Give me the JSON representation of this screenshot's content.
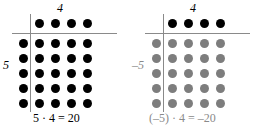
{
  "figures": [
    {
      "id": "positive-product",
      "top_label": "4",
      "side_label": "5",
      "formula": "5 · 4 = 20",
      "dot_color": "#000000",
      "top_row_dot_color": "#000000",
      "axis_color": "#8a8a8a",
      "label_color": "#000000",
      "rows": 5,
      "cols": 5,
      "top_row_count": 4
    },
    {
      "id": "negative-product",
      "top_label": "4",
      "side_label": "–5",
      "formula": "(–5) · 4 = –20",
      "dot_color": "#7d7d7d",
      "top_row_dot_color": "#000000",
      "axis_color": "#8a8a8a",
      "label_color": "#8a8a8a",
      "rows": 5,
      "cols": 5,
      "top_row_count": 4
    }
  ],
  "chart_data": {
    "type": "scatter",
    "title": "",
    "xlabel": "",
    "ylabel": "",
    "panels": [
      {
        "name": "5 times 4",
        "multiplicand": 5,
        "multiplier": 4,
        "product": 20,
        "formula": "5 · 4 = 20",
        "grid_rows": 5,
        "grid_cols": 5,
        "header_row_dots": 4,
        "dot_color": "#000000"
      },
      {
        "name": "negative 5 times 4",
        "multiplicand": -5,
        "multiplier": 4,
        "product": -20,
        "formula": "(–5) · 4 = –20",
        "grid_rows": 5,
        "grid_cols": 5,
        "header_row_dots": 4,
        "dot_color": "#7d7d7d"
      }
    ]
  }
}
